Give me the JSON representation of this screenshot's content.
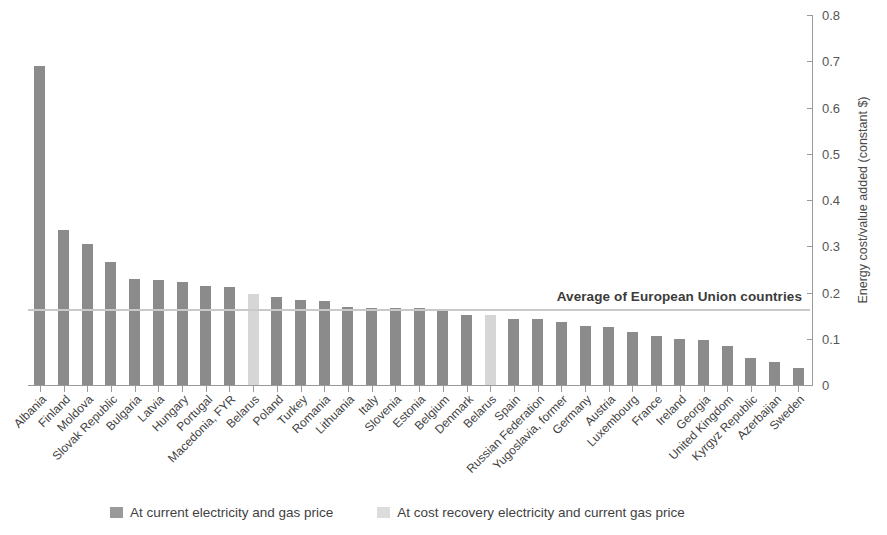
{
  "chart_data": {
    "type": "bar",
    "title": "",
    "xlabel": "",
    "ylabel": "Energy cost/value added (constant $)",
    "ylim": [
      0,
      0.8
    ],
    "yticks": [
      "0",
      "0.1",
      "0.2",
      "0.3",
      "0.4",
      "0.5",
      "0.6",
      "0.7",
      "0.8"
    ],
    "grid": false,
    "legend_position": "bottom",
    "categories": [
      "Albania",
      "Finland",
      "Moldova",
      "Slovak Republic",
      "Bulgaria",
      "Latvia",
      "Hungary",
      "Portugal",
      "Macedonia, FYR",
      "Belarus",
      "Poland",
      "Turkey",
      "Romania",
      "Lithuania",
      "Italy",
      "Slovenia",
      "Estonia",
      "Belgium",
      "Denmark",
      "Belarus",
      "Spain",
      "Russian Federation",
      "Yugoslavia, former",
      "Germany",
      "Austria",
      "Luxembourg",
      "France",
      "Ireland",
      "Georgia",
      "United Kingdom",
      "Kyrgyz Republic",
      "Azerbaijan",
      "Sweden"
    ],
    "values": [
      0.69,
      0.335,
      0.305,
      0.265,
      0.23,
      0.228,
      0.222,
      0.215,
      0.213,
      0.197,
      0.19,
      0.183,
      0.182,
      0.168,
      0.167,
      0.167,
      0.167,
      0.163,
      0.152,
      0.152,
      0.143,
      0.142,
      0.136,
      0.128,
      0.125,
      0.115,
      0.105,
      0.1,
      0.097,
      0.085,
      0.058,
      0.05,
      0.037
    ],
    "series_of_point": [
      "current",
      "current",
      "current",
      "current",
      "current",
      "current",
      "current",
      "current",
      "current",
      "cost_recovery",
      "current",
      "current",
      "current",
      "current",
      "current",
      "current",
      "current",
      "current",
      "current",
      "cost_recovery",
      "current",
      "current",
      "current",
      "current",
      "current",
      "current",
      "current",
      "current",
      "current",
      "current",
      "current",
      "current",
      "current"
    ],
    "annotations": [
      {
        "text": "Average of European Union countries",
        "value": 0.165,
        "style": "horizontal-reference-line"
      }
    ],
    "legend": [
      {
        "label": "At current electricity and gas price",
        "color": "#9a9a9a",
        "key": "current"
      },
      {
        "label": "At cost recovery electricity and current gas price",
        "color": "#dcdcdc",
        "key": "cost_recovery"
      }
    ],
    "colors": {
      "bar_current": "#8b8b8b",
      "bar_cost_recovery": "#d6d6d6",
      "axis": "#9a9a9a",
      "average_line": "#c9c9c9",
      "text": "#3f3f3f"
    }
  }
}
